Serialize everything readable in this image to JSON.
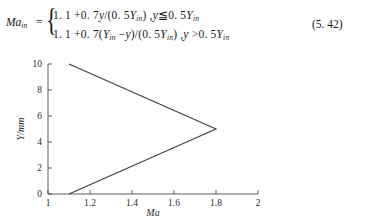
{
  "equation": {
    "lhs_base": "Ma",
    "lhs_sub": "in",
    "equals": "=",
    "case_1": "1. 1 + 0. 7y/(0. 5Yin) , y ≤ 0. 5Yin",
    "case_2": "1. 1 + 0. 7(Yin − y)/(0. 5Yin) , y > 0. 5Yin",
    "number": "(5. 42)"
  },
  "chart_data": {
    "type": "line",
    "title": "",
    "xlabel": "Ma",
    "ylabel": "Y/mm",
    "xlim": [
      1,
      2
    ],
    "ylim": [
      0,
      10
    ],
    "grid": false,
    "legend": "none",
    "x_ticks": [
      1,
      1.2,
      1.4,
      1.6,
      1.8,
      2
    ],
    "x_tick_labels": [
      "1",
      "1.2",
      "1.4",
      "1.6",
      "1.8",
      "2"
    ],
    "y_ticks": [
      0,
      2,
      4,
      6,
      8,
      10
    ],
    "y_tick_labels": [
      "0",
      "2",
      "4",
      "6",
      "8",
      "10"
    ],
    "series": [
      {
        "name": "Ma_in profile",
        "x": [
          1.1,
          1.8,
          1.1
        ],
        "y": [
          0,
          5,
          10
        ]
      }
    ]
  }
}
